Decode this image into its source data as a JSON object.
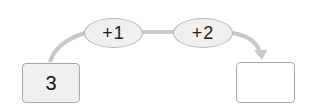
{
  "diagram": {
    "start_value": "3",
    "operations": [
      {
        "label": "+1"
      },
      {
        "label": "+2"
      }
    ],
    "result_value": "",
    "colors": {
      "connector": "#c8c8c8",
      "oval_fill": "#f0f0f0",
      "start_box_fill": "#f0f0f0",
      "end_box_fill": "#ffffff",
      "border": "#a8a8a8"
    }
  }
}
